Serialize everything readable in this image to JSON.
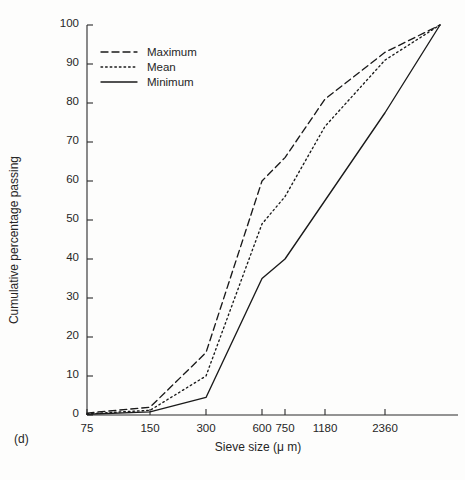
{
  "panel_label": "(d)",
  "legend": {
    "position": "top-left",
    "entries": [
      {
        "label": "Maximum",
        "style": "dashed"
      },
      {
        "label": "Mean",
        "style": "dotted"
      },
      {
        "label": "Minimum",
        "style": "solid"
      }
    ]
  },
  "axes": {
    "x_title": "Sieve size (μ m)",
    "y_title": "Cumulative percentage passing",
    "x_tick_labels": [
      "75",
      "150",
      "300",
      "600",
      "750",
      "1180",
      "2360"
    ],
    "y_tick_labels": [
      "0",
      "10",
      "20",
      "30",
      "40",
      "50",
      "60",
      "70",
      "80",
      "90",
      "100"
    ]
  },
  "chart_data": {
    "type": "line",
    "title": "",
    "xlabel": "Sieve size (μ m)",
    "ylabel": "Cumulative percentage passing",
    "x_scale": "sieve-size-ordinal",
    "categories": [
      75,
      150,
      300,
      600,
      750,
      1180,
      2360,
      5000
    ],
    "x_tick_labels": [
      "75",
      "150",
      "300",
      "600",
      "750",
      "1180",
      "2360"
    ],
    "ylim": [
      0,
      100
    ],
    "y_ticks": [
      0,
      10,
      20,
      30,
      40,
      50,
      60,
      70,
      80,
      90,
      100
    ],
    "grid": false,
    "legend_position": "top-left",
    "series": [
      {
        "name": "Maximum",
        "style": "dashed",
        "values": [
          0.5,
          2.0,
          16.0,
          60.0,
          66.0,
          81.0,
          93.0,
          100.0
        ]
      },
      {
        "name": "Mean",
        "style": "dotted",
        "values": [
          0.3,
          1.2,
          10.0,
          49.0,
          56.0,
          74.0,
          91.0,
          100.0
        ]
      },
      {
        "name": "Minimum",
        "style": "solid",
        "values": [
          0.2,
          0.8,
          4.5,
          35.0,
          40.0,
          55.0,
          77.5,
          100.0
        ]
      }
    ]
  },
  "geometry": {
    "x_pixels": [
      87,
      150,
      206,
      262,
      285,
      325,
      385,
      440
    ],
    "y_top_px": 25,
    "y_bottom_px": 415
  }
}
